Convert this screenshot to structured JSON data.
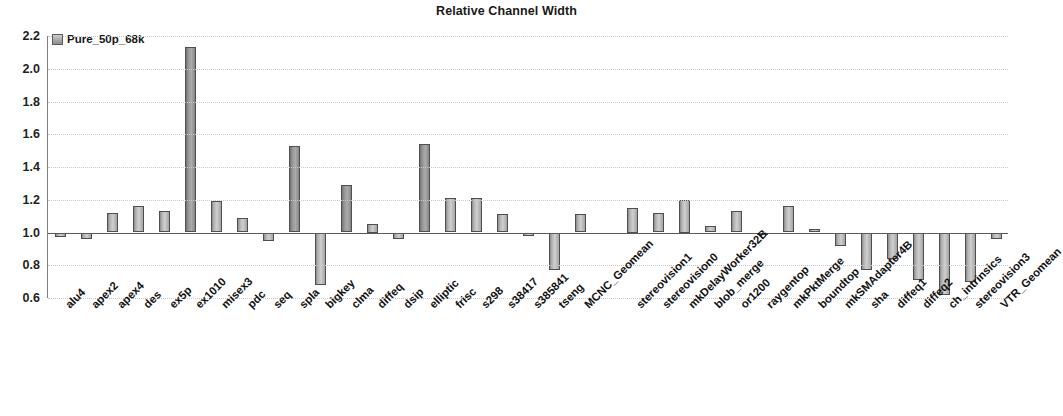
{
  "chart_data": {
    "type": "bar",
    "title": "Relative Channel Width",
    "xlabel": "",
    "ylabel": "",
    "ylim": [
      0.6,
      2.2
    ],
    "ytick_labels": [
      "2.2",
      "2.0",
      "1.8",
      "1.6",
      "1.4",
      "1.2",
      "1.0",
      "0.8",
      "0.6"
    ],
    "yticks": [
      2.2,
      2.0,
      1.8,
      1.6,
      1.4,
      1.2,
      1.0,
      0.8,
      0.6
    ],
    "baseline": 1.0,
    "grid": true,
    "legend": [
      "Pure_50p_68k"
    ],
    "legend_position": "top-left-inside",
    "series": [
      {
        "name": "Pure_50p_68k",
        "values": [
          0.97,
          0.96,
          1.12,
          1.16,
          1.13,
          2.13,
          1.19,
          1.09,
          0.95,
          1.53,
          0.68,
          1.29,
          1.05,
          0.96,
          1.54,
          1.21,
          1.21,
          1.11,
          0.98,
          0.77,
          1.11,
          null,
          1.15,
          1.12,
          1.2,
          1.04,
          1.13,
          1.0,
          1.16,
          1.02,
          0.92,
          0.77,
          0.84,
          0.71,
          0.62,
          0.7,
          0.96
        ]
      }
    ],
    "categories": [
      "alu4",
      "apex2",
      "apex4",
      "des",
      "ex5p",
      "ex1010",
      "misex3",
      "pdc",
      "seq",
      "spla",
      "bigkey",
      "clma",
      "diffeq",
      "dsip",
      "elliptic",
      "frisc",
      "s298",
      "s38417",
      "s385841",
      "tseng",
      "MCNC_Geomean",
      "",
      "stereovision1",
      "stereovision0",
      "mkDelayWorker32B",
      "blob_merge",
      "or1200",
      "raygentop",
      "mkPktMerge",
      "boundtop",
      "mkSMAdapter4B",
      "sha",
      "diffeq1",
      "diffeq2",
      "ch_intrinsics",
      "stereovision3",
      "VTR_Geomean"
    ]
  },
  "colors": {
    "bar_fill": "#b4b4b4",
    "bar_edge": "#4f4f4f",
    "grid": "#c8c8c8",
    "axis": "#5a5a5a",
    "text": "#121212",
    "background": "#ffffff"
  }
}
